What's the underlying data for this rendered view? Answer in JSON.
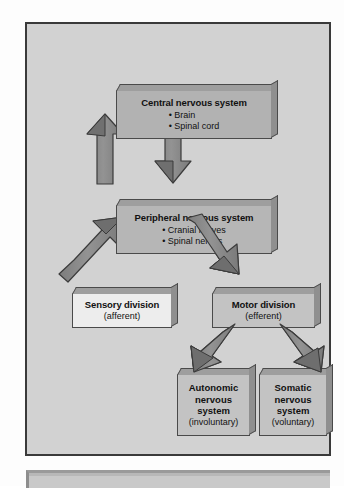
{
  "diagram": {
    "title_hidden": "",
    "colors": {
      "panel_bg": "#d2d2d2",
      "panel_border": "#3a3a3a",
      "box_dark": "#b2b2b2",
      "box_light": "#ededed",
      "box_mid": "#c3c3c3",
      "arrow_fill": "#8d8d8d",
      "arrow_stroke": "#3b3b3b"
    },
    "nodes": {
      "cns": {
        "title": "Central nervous system",
        "bullets": [
          "• Brain",
          "• Spinal cord"
        ]
      },
      "pns": {
        "title": "Peripheral nervous system",
        "bullets": [
          "• Cranial nerves",
          "• Spinal nerves"
        ]
      },
      "sensory": {
        "title": "Sensory division",
        "subtitle": "(afferent)"
      },
      "motor": {
        "title": "Motor division",
        "subtitle": "(efferent)"
      },
      "autonomic": {
        "line1": "Autonomic",
        "line2": "nervous",
        "line3": "system",
        "subtitle": "(involuntary)"
      },
      "somatic": {
        "line1": "Somatic",
        "line2": "nervous",
        "line3": "system",
        "subtitle": "(voluntary)"
      }
    },
    "edges": [
      {
        "name": "pns-to-cns",
        "from": "pns",
        "to": "cns",
        "direction": "up"
      },
      {
        "name": "cns-to-pns",
        "from": "cns",
        "to": "pns",
        "direction": "down"
      },
      {
        "name": "sensory-to-pns",
        "from": "sensory",
        "to": "pns",
        "direction": "up-right"
      },
      {
        "name": "pns-to-motor",
        "from": "pns",
        "to": "motor",
        "direction": "down-right"
      },
      {
        "name": "motor-to-autonomic",
        "from": "motor",
        "to": "autonomic",
        "direction": "down-left"
      },
      {
        "name": "motor-to-somatic",
        "from": "motor",
        "to": "somatic",
        "direction": "down-right"
      }
    ]
  }
}
